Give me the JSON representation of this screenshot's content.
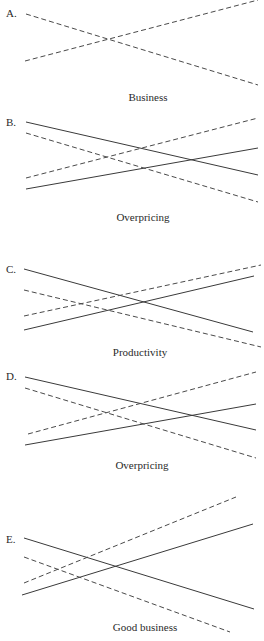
{
  "figure": {
    "panels": [
      {
        "letter": "A.",
        "caption": "Business",
        "lines": [
          {
            "style": "dashed",
            "direction": "descending"
          },
          {
            "style": "dashed",
            "direction": "ascending"
          }
        ]
      },
      {
        "letter": "B.",
        "caption": "Overpricing",
        "lines": [
          {
            "style": "solid",
            "direction": "descending"
          },
          {
            "style": "solid",
            "direction": "ascending"
          },
          {
            "style": "dashed",
            "direction": "descending"
          },
          {
            "style": "dashed",
            "direction": "ascending"
          }
        ]
      },
      {
        "letter": "C.",
        "caption": "Productivity",
        "lines": [
          {
            "style": "solid",
            "direction": "descending"
          },
          {
            "style": "solid",
            "direction": "ascending"
          },
          {
            "style": "dashed",
            "direction": "descending"
          },
          {
            "style": "dashed",
            "direction": "ascending"
          }
        ]
      },
      {
        "letter": "D.",
        "caption": "Overpricing",
        "lines": [
          {
            "style": "solid",
            "direction": "descending"
          },
          {
            "style": "solid",
            "direction": "ascending"
          },
          {
            "style": "dashed",
            "direction": "descending"
          },
          {
            "style": "dashed",
            "direction": "ascending"
          }
        ]
      },
      {
        "letter": "E.",
        "caption": "Good business",
        "lines": [
          {
            "style": "solid",
            "direction": "descending"
          },
          {
            "style": "solid",
            "direction": "ascending"
          },
          {
            "style": "dashed",
            "direction": "descending"
          },
          {
            "style": "dashed",
            "direction": "ascending"
          }
        ]
      }
    ]
  }
}
